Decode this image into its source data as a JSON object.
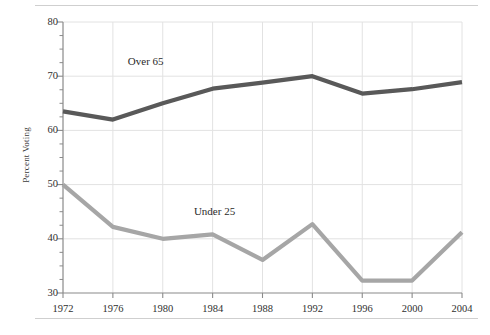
{
  "chart_data": {
    "type": "line",
    "title": "",
    "subtitle": "",
    "xlabel": "",
    "ylabel": "Percent Voting",
    "categories": [
      "1972",
      "1976",
      "1980",
      "1984",
      "1988",
      "1992",
      "1996",
      "2000",
      "2004"
    ],
    "x": [
      1972,
      1976,
      1980,
      1984,
      1988,
      1992,
      1996,
      2000,
      2004
    ],
    "xlim": [
      1972,
      2004
    ],
    "ylim": [
      30,
      80
    ],
    "y_ticks": [
      30,
      40,
      50,
      60,
      70,
      80
    ],
    "y_minor_tick_step": 2.5,
    "grid": "horizontal-and-vertical",
    "legend": "inline-labels",
    "series": [
      {
        "name": "Over 65",
        "color": "#595959",
        "values": [
          63.5,
          62.0,
          65.0,
          67.7,
          68.8,
          70.0,
          66.8,
          67.6,
          68.9
        ],
        "label_position": {
          "x": 1977.2,
          "y": 72.6
        }
      },
      {
        "name": "Under 25",
        "color": "#a6a6a6",
        "values": [
          50.0,
          42.2,
          40.0,
          40.8,
          36.1,
          42.7,
          32.3,
          32.3,
          41.2
        ],
        "label_position": {
          "x": 1982.5,
          "y": 45.0
        }
      }
    ],
    "annotations": [
      {
        "text": "Over 65",
        "series": "Over 65"
      },
      {
        "text": "Under 25",
        "series": "Under 25"
      }
    ],
    "colors": {
      "over_65": "#595959",
      "under_25": "#a6a6a6",
      "grid": "#e2e2e2",
      "axis": "#8a8a8a",
      "rule": "#cfcfcf",
      "text": "#2f2f2f"
    }
  },
  "axes": {
    "y_label": "Percent Voting",
    "y_tick_labels": [
      "80",
      "70",
      "60",
      "50",
      "40",
      "30"
    ],
    "x_tick_labels": [
      "1972",
      "1976",
      "1980",
      "1984",
      "1988",
      "1992",
      "1996",
      "2000",
      "2004"
    ]
  },
  "labels": {
    "over_65": "Over 65",
    "under_25": "Under 25"
  }
}
